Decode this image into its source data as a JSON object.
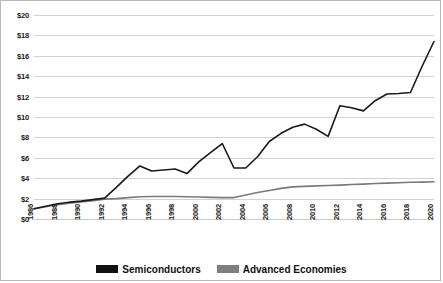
{
  "chart_data": {
    "type": "line",
    "title": "",
    "subtitle": "",
    "xlabel": "",
    "ylabel": "",
    "xlim": [
      1986,
      2020
    ],
    "ylim": [
      0,
      20
    ],
    "y_tick_step": 2,
    "grid": true,
    "legend_position": "bottom",
    "y_tick_labels": [
      "$20",
      "$18",
      "$16",
      "$14",
      "$12",
      "$10",
      "$8",
      "$6",
      "$4",
      "$2",
      "$0"
    ],
    "y_tick_values": [
      20,
      18,
      16,
      14,
      12,
      10,
      8,
      6,
      4,
      2,
      0
    ],
    "x_tick_labels": [
      "1986",
      "1988",
      "1990",
      "1992",
      "1994",
      "1996",
      "1998",
      "2000",
      "2002",
      "2004",
      "2006",
      "2008",
      "2010",
      "2012",
      "2014",
      "2016",
      "2018",
      "2020"
    ],
    "x_tick_values": [
      1986,
      1988,
      1990,
      1992,
      1994,
      1996,
      1998,
      2000,
      2002,
      2004,
      2006,
      2008,
      2010,
      2012,
      2014,
      2016,
      2018,
      2020
    ],
    "x": [
      1986,
      1987,
      1988,
      1989,
      1990,
      1991,
      1992,
      1993,
      1994,
      1995,
      1996,
      1997,
      1998,
      1999,
      2000,
      2001,
      2002,
      2003,
      2004,
      2005,
      2006,
      2007,
      2008,
      2009,
      2010,
      2011,
      2012,
      2013,
      2014,
      2015,
      2016,
      2017,
      2018,
      2019,
      2020
    ],
    "series": [
      {
        "name": "Semiconductors",
        "color": "#1a1a1a",
        "values": [
          1.0,
          1.25,
          1.5,
          1.65,
          1.75,
          1.9,
          2.05,
          3.1,
          4.2,
          5.2,
          4.7,
          4.8,
          4.9,
          4.45,
          5.6,
          6.5,
          7.4,
          5.0,
          5.0,
          6.1,
          7.6,
          8.4,
          9.0,
          9.3,
          8.8,
          8.1,
          11.1,
          10.9,
          10.6,
          11.6,
          12.25,
          12.3,
          12.4,
          15.0,
          17.4
        ]
      },
      {
        "name": "Advanced Economies",
        "color": "#7a7a7a",
        "values": [
          1.0,
          1.2,
          1.4,
          1.55,
          1.68,
          1.8,
          1.95,
          2.0,
          2.1,
          2.18,
          2.2,
          2.2,
          2.2,
          2.18,
          2.15,
          2.12,
          2.1,
          2.1,
          2.35,
          2.6,
          2.8,
          3.0,
          3.15,
          3.2,
          3.25,
          3.28,
          3.32,
          3.38,
          3.42,
          3.48,
          3.52,
          3.56,
          3.6,
          3.62,
          3.65
        ]
      }
    ],
    "semiconductors_points": [
      {
        "year": 1986,
        "value": 1.0
      },
      {
        "year": 1988,
        "value": 1.5
      },
      {
        "year": 1990,
        "value": 1.75
      },
      {
        "year": 1992,
        "value": 2.05
      },
      {
        "year": 1994,
        "value": 4.2
      },
      {
        "year": 1995,
        "value": 5.2
      },
      {
        "year": 1996,
        "value": 4.7
      },
      {
        "year": 1997,
        "value": 4.8
      },
      {
        "year": 1998,
        "value": 4.9
      },
      {
        "year": 1999,
        "value": 4.45
      },
      {
        "year": 2000,
        "value": 7.4
      },
      {
        "year": 2001,
        "value": 5.0
      },
      {
        "year": 2002,
        "value": 5.0
      },
      {
        "year": 2004,
        "value": 6.1
      },
      {
        "year": 2006,
        "value": 8.4
      },
      {
        "year": 2007,
        "value": 9.3
      },
      {
        "year": 2009,
        "value": 8.1
      },
      {
        "year": 2010,
        "value": 11.1
      },
      {
        "year": 2012,
        "value": 10.6
      },
      {
        "year": 2014,
        "value": 12.25
      },
      {
        "year": 2016,
        "value": 12.4
      },
      {
        "year": 2018,
        "value": 17.4
      },
      {
        "year": 2019,
        "value": 15.3
      },
      {
        "year": 2020,
        "value": 16.6
      }
    ],
    "advanced_economies_points": [
      {
        "year": 1986,
        "value": 1.0
      },
      {
        "year": 1990,
        "value": 1.68
      },
      {
        "year": 1992,
        "value": 1.95
      },
      {
        "year": 1996,
        "value": 2.2
      },
      {
        "year": 2000,
        "value": 2.15
      },
      {
        "year": 2003,
        "value": 2.1
      },
      {
        "year": 2008,
        "value": 3.15
      },
      {
        "year": 2012,
        "value": 3.32
      },
      {
        "year": 2016,
        "value": 3.52
      },
      {
        "year": 2020,
        "value": 3.65
      }
    ]
  },
  "legend": {
    "entries": [
      {
        "label": "Semiconductors",
        "color": "#111111"
      },
      {
        "label": "Advanced  Economies",
        "color": "#7f7f7f"
      }
    ]
  }
}
